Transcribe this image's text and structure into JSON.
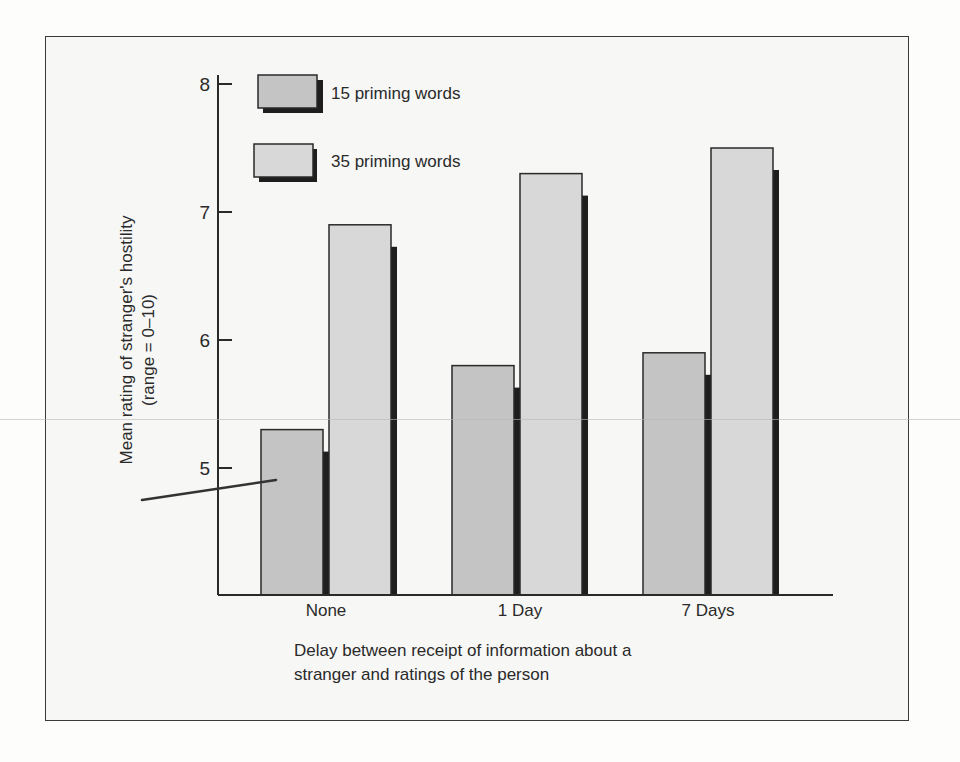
{
  "chart_data": {
    "type": "bar",
    "title": "",
    "xlabel": "Delay between receipt of information about a stranger and ratings of the person",
    "xlabel_lines": [
      "Delay between receipt of information about a",
      "stranger and ratings of the person"
    ],
    "ylabel": "Mean rating of stranger's hostility (range = 0–10)",
    "ylabel_lines": [
      "Mean rating of stranger's hostility",
      "(range = 0–10)"
    ],
    "categories": [
      "None",
      "1 Day",
      "7 Days"
    ],
    "series": [
      {
        "name": "15 priming words",
        "values": [
          5.3,
          5.8,
          5.9
        ],
        "color": "#c4c4c4"
      },
      {
        "name": "35 priming words",
        "values": [
          6.9,
          7.3,
          7.5
        ],
        "color": "#d8d8d8"
      }
    ],
    "yticks": [
      5,
      6,
      7,
      8
    ],
    "ytick_labels": [
      "5",
      "6",
      "7",
      "8"
    ],
    "ylim": [
      4,
      8
    ],
    "grid": false,
    "legend_position": "top-left",
    "colors": {
      "bar_outline": "#2a2a2a",
      "bar_shadow": "#1e1e1e",
      "axis": "#2a2a2a"
    }
  }
}
